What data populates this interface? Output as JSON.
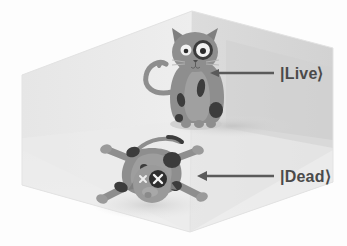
{
  "figure": {
    "background_color": "#fdfdfd"
  },
  "room": {
    "name": "isometric-hexagonal-room",
    "floor_color": "#ececec",
    "left_wall_color": "#e4e4e4",
    "right_wall_color": "#d9d9d9",
    "back_wall_color": "#eeeeee",
    "edge_color": "#d2d2d2"
  },
  "states": [
    {
      "id": "live",
      "label": "|Live⟩",
      "label_x": 280,
      "label_y": 79,
      "arrow": {
        "name": "arrow-to-live-cat",
        "from_x": 274,
        "to_x": 212,
        "y": 73,
        "color": "#5a5a5a",
        "direction": "left"
      }
    },
    {
      "id": "dead",
      "label": "|Dead⟩",
      "label_x": 280,
      "label_y": 182,
      "arrow": {
        "name": "arrow-to-dead-cat",
        "from_x": 274,
        "to_x": 198,
        "y": 176,
        "color": "#5a5a5a",
        "direction": "left"
      }
    }
  ],
  "cats": {
    "live": {
      "name": "live-cat",
      "pose": "sitting upright, alert",
      "body_color": "#8e8e8e",
      "belly_color": "#a2a2a2",
      "spot_color": "#3a3a3a",
      "eye_white": "#f4f4f4",
      "eye_pupil": "#2c2c2c",
      "shadow_color": "#cfcfcf",
      "features": [
        "two pointed ears",
        "curved S tail",
        "dark eye patch ring",
        "dark body spots",
        "four paws",
        "whiskers"
      ]
    },
    "dead": {
      "name": "dead-cat",
      "pose": "lying flat on back, limbs splayed",
      "body_color": "#8e8e8e",
      "belly_color": "#a2a2a2",
      "spot_color": "#3a3a3a",
      "eye_mark": "X",
      "eye_mark_color": "#f4f4f4",
      "shadow_color": "#dcdcdc",
      "features": [
        "two X eyes",
        "limp tail",
        "four splayed limbs",
        "dark body spots",
        "tongue out"
      ]
    }
  }
}
